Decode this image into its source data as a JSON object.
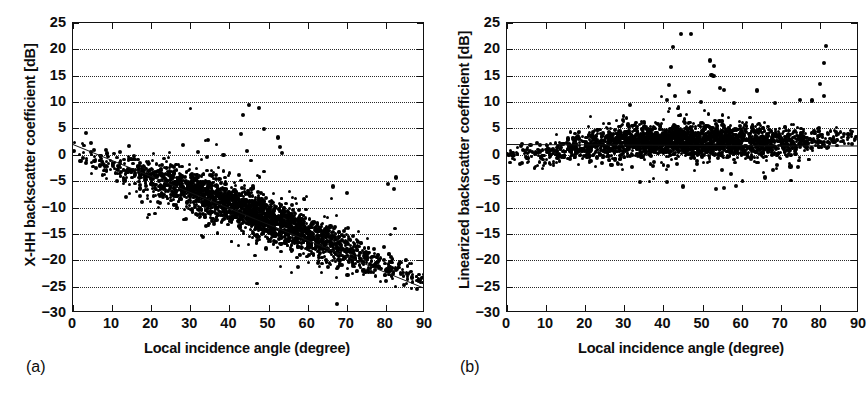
{
  "figure": {
    "panels": [
      {
        "id": "a",
        "caption": "(a)",
        "ylabel": "X-HH backscatter coefficient [dB]",
        "xlabel": "Local incidence angle (degree)"
      },
      {
        "id": "b",
        "caption": "(b)",
        "ylabel": "Linearized backscatter coefficient [dB]",
        "xlabel": "Local incidence angle (degree)"
      }
    ]
  },
  "chart_data": [
    {
      "type": "scatter",
      "panel": "a",
      "title": "",
      "xlabel": "Local incidence angle (degree)",
      "ylabel": "X-HH backscatter coefficient [dB]",
      "xlim": [
        0,
        90
      ],
      "ylim": [
        -30,
        25
      ],
      "xticks": [
        0,
        10,
        20,
        30,
        40,
        50,
        60,
        70,
        80,
        90
      ],
      "yticks": [
        -30,
        -25,
        -20,
        -15,
        -10,
        -5,
        0,
        5,
        10,
        15,
        20,
        25
      ],
      "grid": "horizontal-dotted",
      "legend": "none",
      "marker_color": "#000000",
      "fit_line": {
        "type": "linear",
        "x": [
          0,
          90
        ],
        "y": [
          2.0,
          -25.3
        ],
        "slope": -0.303,
        "intercept": 2.0,
        "color": "#111111"
      },
      "n_points": 2600,
      "cluster": {
        "x_range": [
          0,
          90
        ],
        "core_x_range": [
          22,
          68
        ],
        "trend_at_x": [
          {
            "x": 0,
            "y": 0.2
          },
          {
            "x": 10,
            "y": -2.0
          },
          {
            "x": 20,
            "y": -4.2
          },
          {
            "x": 30,
            "y": -6.6
          },
          {
            "x": 40,
            "y": -9.3
          },
          {
            "x": 50,
            "y": -12.2
          },
          {
            "x": 60,
            "y": -15.2
          },
          {
            "x": 70,
            "y": -18.3
          },
          {
            "x": 80,
            "y": -21.3
          },
          {
            "x": 90,
            "y": -23.5
          }
        ],
        "spread_db": 3.2
      },
      "outliers": [
        {
          "x": 43.5,
          "y": 7.6
        },
        {
          "x": 45.0,
          "y": 9.4
        },
        {
          "x": 47.5,
          "y": 8.9
        },
        {
          "x": 43.0,
          "y": 4.0
        },
        {
          "x": 48.8,
          "y": 4.9
        },
        {
          "x": 52.5,
          "y": 3.3
        },
        {
          "x": 44.5,
          "y": 0.8
        },
        {
          "x": 53.0,
          "y": 1.5
        },
        {
          "x": 53.5,
          "y": 0.4
        },
        {
          "x": 32.0,
          "y": 0.6
        },
        {
          "x": 38.5,
          "y": 0.0
        },
        {
          "x": 80.5,
          "y": -5.5
        },
        {
          "x": 82.5,
          "y": -4.3
        },
        {
          "x": 82.0,
          "y": -6.5
        },
        {
          "x": 66.5,
          "y": -6.0
        },
        {
          "x": 70.0,
          "y": -7.3
        },
        {
          "x": 57.5,
          "y": -21.3
        },
        {
          "x": 34.0,
          "y": -13.5
        }
      ]
    },
    {
      "type": "scatter",
      "panel": "b",
      "title": "",
      "xlabel": "Local incidence angle (degree)",
      "ylabel": "Linearized backscatter coefficient [dB]",
      "xlim": [
        0,
        90
      ],
      "ylim": [
        -30,
        25
      ],
      "xticks": [
        0,
        10,
        20,
        30,
        40,
        50,
        60,
        70,
        80,
        90
      ],
      "yticks": [
        -30,
        -25,
        -20,
        -15,
        -10,
        -5,
        0,
        5,
        10,
        15,
        20,
        25
      ],
      "grid": "horizontal-dotted",
      "legend": "none",
      "marker_color": "#000000",
      "fit_line": {
        "type": "linear",
        "x": [
          0,
          90
        ],
        "y": [
          2.1,
          1.8
        ],
        "slope": -0.003,
        "intercept": 2.1,
        "color": "#111111"
      },
      "n_points": 2600,
      "cluster": {
        "x_range": [
          0,
          90
        ],
        "core_x_range": [
          22,
          68
        ],
        "trend_at_x": [
          {
            "x": 0,
            "y": 0.1
          },
          {
            "x": 10,
            "y": 0.2
          },
          {
            "x": 20,
            "y": 1.6
          },
          {
            "x": 30,
            "y": 2.6
          },
          {
            "x": 40,
            "y": 2.7
          },
          {
            "x": 50,
            "y": 2.6
          },
          {
            "x": 60,
            "y": 2.5
          },
          {
            "x": 70,
            "y": 2.2
          },
          {
            "x": 80,
            "y": 2.6
          },
          {
            "x": 90,
            "y": 3.6
          }
        ],
        "spread_db": 2.6
      },
      "outliers": [
        {
          "x": 44.5,
          "y": 22.9
        },
        {
          "x": 47.0,
          "y": 22.9
        },
        {
          "x": 42.5,
          "y": 20.5
        },
        {
          "x": 81.5,
          "y": 20.6
        },
        {
          "x": 42.0,
          "y": 16.7
        },
        {
          "x": 52.0,
          "y": 17.9
        },
        {
          "x": 53.0,
          "y": 16.8
        },
        {
          "x": 81.0,
          "y": 17.4
        },
        {
          "x": 52.3,
          "y": 15.2
        },
        {
          "x": 52.8,
          "y": 14.9
        },
        {
          "x": 41.5,
          "y": 13.3
        },
        {
          "x": 46.5,
          "y": 11.9
        },
        {
          "x": 43.0,
          "y": 11.2
        },
        {
          "x": 80.0,
          "y": 13.5
        },
        {
          "x": 54.5,
          "y": 12.6
        },
        {
          "x": 55.5,
          "y": 12.3
        },
        {
          "x": 64.0,
          "y": 12.2
        },
        {
          "x": 75.0,
          "y": 10.4
        },
        {
          "x": 78.0,
          "y": 10.3
        },
        {
          "x": 81.0,
          "y": 11.1
        },
        {
          "x": 49.5,
          "y": 10.0
        },
        {
          "x": 58.0,
          "y": 9.8
        },
        {
          "x": 68.5,
          "y": 9.9
        },
        {
          "x": 34.0,
          "y": -5.1
        },
        {
          "x": 41.0,
          "y": -5.2
        },
        {
          "x": 45.0,
          "y": -6.0
        },
        {
          "x": 53.5,
          "y": -6.5
        },
        {
          "x": 55.5,
          "y": -6.3
        },
        {
          "x": 58.5,
          "y": -5.9
        },
        {
          "x": 66.0,
          "y": -4.3
        },
        {
          "x": 72.5,
          "y": -2.2
        },
        {
          "x": 74.5,
          "y": -2.3
        }
      ]
    }
  ]
}
